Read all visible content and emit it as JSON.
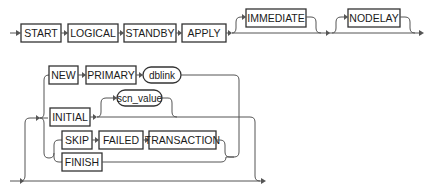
{
  "diagram": {
    "type": "railroad-syntax",
    "statement": {
      "keywords": [
        "START",
        "LOGICAL",
        "STANDBY",
        "APPLY"
      ],
      "optional": [
        "IMMEDIATE",
        "NODELAY"
      ]
    },
    "alternatives": {
      "new_primary": {
        "keywords": [
          "NEW",
          "PRIMARY"
        ],
        "variable": "dblink"
      },
      "initial": {
        "keyword": "INITIAL",
        "optional_variable": "scn_value"
      },
      "skip_failed": {
        "keywords": [
          "SKIP",
          "FAILED",
          "TRANSACTION"
        ]
      },
      "finish": {
        "keyword": "FINISH"
      }
    }
  }
}
